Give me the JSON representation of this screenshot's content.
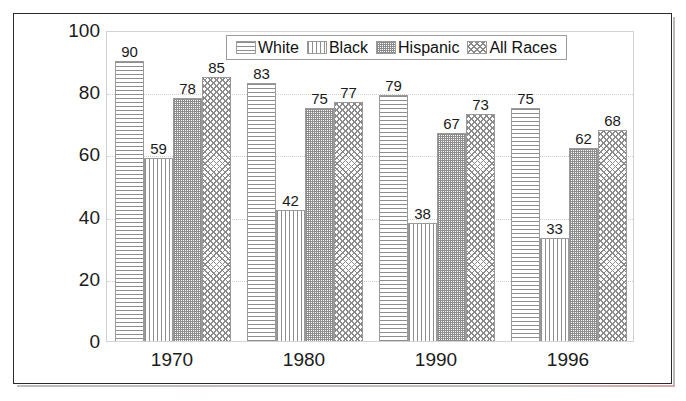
{
  "chart_data": {
    "type": "bar",
    "title": "",
    "subtitle": "",
    "xlabel": "",
    "ylabel": "",
    "categories": [
      "1970",
      "1980",
      "1990",
      "1996"
    ],
    "series": [
      {
        "name": "White",
        "pattern": "horizontal-lines",
        "values": [
          90,
          83,
          79,
          75
        ]
      },
      {
        "name": "Black",
        "pattern": "vertical-lines",
        "values": [
          59,
          42,
          38,
          33
        ]
      },
      {
        "name": "Hispanic",
        "pattern": "fine-stipple",
        "values": [
          78,
          75,
          67,
          62
        ]
      },
      {
        "name": "All Races",
        "pattern": "crosshatch",
        "values": [
          85,
          77,
          73,
          68
        ]
      }
    ],
    "ylim": [
      0,
      100
    ],
    "y_ticks": [
      "0",
      "20",
      "40",
      "60",
      "80",
      "100"
    ],
    "grid": true,
    "grid_style": "dotted-horizontal",
    "legend_position": "top-center",
    "data_labels": true,
    "colors": {
      "bar_outline": "#9a9a9a",
      "hatch": "#8e8e8e",
      "text": "#1b1b1b",
      "gridline": "#cfcfcf",
      "frame": "#2a2a2a",
      "plot_border": "#d2d2d2",
      "background": "#ffffff"
    }
  },
  "legend": {
    "items": [
      {
        "label": "White"
      },
      {
        "label": "Black"
      },
      {
        "label": "Hispanic"
      },
      {
        "label": "All Races"
      }
    ]
  }
}
